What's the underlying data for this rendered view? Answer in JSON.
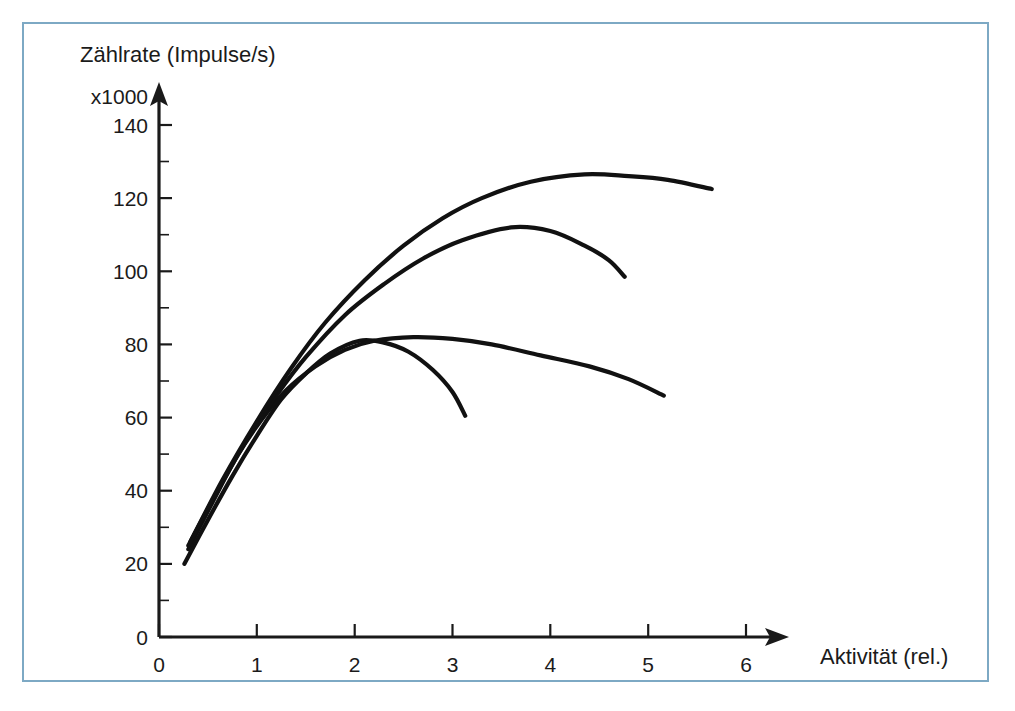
{
  "figure": {
    "border_color": "#7da9c4",
    "background_color": "#ffffff",
    "ink_color": "#111111"
  },
  "chart_data": {
    "type": "line",
    "title": "",
    "subtitle": "",
    "ylabel": "Zählrate  (Impulse/s)",
    "y_multiplier_label": "x1000",
    "xlabel": "Aktivität (rel.)",
    "xlim": [
      0,
      6.6
    ],
    "ylim": [
      0,
      147
    ],
    "grid": false,
    "legend": "none",
    "x_ticks": [
      0,
      1,
      2,
      3,
      4,
      5,
      6
    ],
    "x_tick_labels": [
      "0",
      "1",
      "2",
      "3",
      "4",
      "5",
      "6"
    ],
    "x_minor_ticks": [],
    "y_ticks": [
      0,
      20,
      40,
      60,
      80,
      100,
      120,
      140
    ],
    "y_tick_labels": [
      "0",
      "20",
      "40",
      "60",
      "80",
      "100",
      "120",
      "140"
    ],
    "y_minor_ticks": [
      10,
      30,
      50,
      70,
      90,
      110,
      130
    ],
    "axis_style": "arrow-tipped-L",
    "series": [
      {
        "name": "curve-a-lowest-peak",
        "peak_x": 2.05,
        "peak_y": 81,
        "x": [
          0.26,
          0.5,
          0.75,
          1.0,
          1.25,
          1.5,
          1.75,
          2.05,
          2.3,
          2.55,
          2.8,
          3.0,
          3.13
        ],
        "y": [
          20,
          32,
          44,
          55,
          65,
          72,
          77.5,
          81,
          80.5,
          78,
          73,
          67,
          60.5
        ]
      },
      {
        "name": "curve-b-flat-plateau",
        "peak_x": 2.6,
        "peak_y": 82,
        "x": [
          0.3,
          0.55,
          0.8,
          1.05,
          1.3,
          1.6,
          1.9,
          2.2,
          2.6,
          3.0,
          3.4,
          3.9,
          4.4,
          4.8,
          5.16
        ],
        "y": [
          24,
          37,
          49.5,
          59.5,
          67.5,
          74,
          78.5,
          81,
          82,
          81.5,
          80,
          77,
          74,
          70.5,
          66
        ]
      },
      {
        "name": "curve-c-mid-peak",
        "peak_x": 3.6,
        "peak_y": 112,
        "x": [
          0.3,
          0.6,
          0.9,
          1.2,
          1.5,
          1.9,
          2.3,
          2.7,
          3.1,
          3.6,
          4.0,
          4.35,
          4.6,
          4.76
        ],
        "y": [
          25,
          40,
          54,
          66,
          76.5,
          88,
          96.5,
          103.5,
          108.5,
          112,
          111,
          107,
          103,
          98.5
        ]
      },
      {
        "name": "curve-d-highest-peak",
        "peak_x": 4.35,
        "peak_y": 126.5,
        "x": [
          0.32,
          0.65,
          1.0,
          1.35,
          1.7,
          2.1,
          2.5,
          2.9,
          3.3,
          3.8,
          4.35,
          4.8,
          5.2,
          5.65
        ],
        "y": [
          26,
          43,
          59,
          73.5,
          86,
          97.5,
          107,
          114.5,
          120,
          124.5,
          126.5,
          126,
          125,
          122.5
        ]
      }
    ]
  }
}
